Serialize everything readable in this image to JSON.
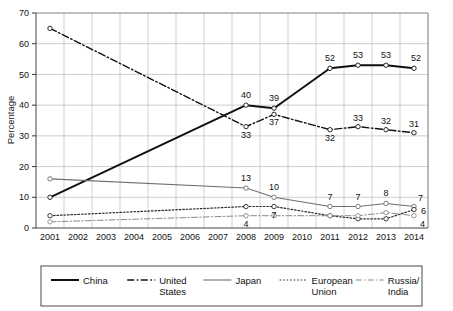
{
  "chart_data": {
    "type": "line",
    "title": "",
    "xlabel": "",
    "ylabel": "Percentage",
    "xlim": [
      2001,
      2014
    ],
    "ylim": [
      0,
      70
    ],
    "grid": true,
    "legend_position": "bottom",
    "categories": [
      2001,
      2002,
      2003,
      2004,
      2005,
      2006,
      2007,
      2008,
      2009,
      2010,
      2011,
      2012,
      2013,
      2014
    ],
    "x_tick_labels": [
      "2001",
      "2002",
      "2003",
      "2004",
      "2005",
      "2006",
      "2007",
      "2008",
      "2009",
      "2010",
      "2011",
      "2012",
      "2013",
      "2014"
    ],
    "y_tick_labels": [
      "0",
      "10",
      "20",
      "30",
      "40",
      "50",
      "60",
      "70"
    ],
    "y_ticks": [
      0,
      10,
      20,
      30,
      40,
      50,
      60,
      70
    ],
    "series": [
      {
        "name": "China",
        "style": "solid-thick",
        "color": "#111111",
        "x": [
          2001,
          2008,
          2009,
          2011,
          2012,
          2013,
          2014
        ],
        "values": [
          10,
          40,
          39,
          52,
          53,
          53,
          52
        ],
        "point_labels": [
          "",
          "40",
          "39",
          "52",
          "53",
          "53",
          "52"
        ]
      },
      {
        "name": "United States",
        "style": "dash-dot",
        "color": "#111111",
        "x": [
          2001,
          2008,
          2009,
          2011,
          2012,
          2013,
          2014
        ],
        "values": [
          65,
          33,
          37,
          32,
          33,
          32,
          31
        ],
        "point_labels": [
          "",
          "33",
          "37",
          "32",
          "33",
          "32",
          "31"
        ]
      },
      {
        "name": "Japan",
        "style": "solid-thin",
        "color": "#6e6e6e",
        "x": [
          2001,
          2008,
          2009,
          2011,
          2012,
          2013,
          2014
        ],
        "values": [
          16,
          13,
          10,
          7,
          7,
          8,
          7
        ],
        "point_labels": [
          "",
          "13",
          "10",
          "7",
          "7",
          "8",
          "7"
        ]
      },
      {
        "name": "European Union",
        "style": "dotted",
        "color": "#2a2a2a",
        "x": [
          2001,
          2008,
          2009,
          2011,
          2012,
          2013,
          2014
        ],
        "values": [
          4,
          7,
          7,
          4,
          3,
          3,
          6
        ],
        "point_labels": [
          "",
          "",
          "7",
          "",
          "",
          "",
          "6"
        ]
      },
      {
        "name": "Russia/India",
        "style": "dash-dot-thin",
        "color": "#8a8a8a",
        "x": [
          2001,
          2008,
          2009,
          2011,
          2012,
          2013,
          2014
        ],
        "values": [
          2,
          4,
          4,
          4,
          4,
          5,
          4
        ],
        "point_labels": [
          "",
          "4",
          "",
          "",
          "",
          "",
          "4"
        ]
      }
    ]
  },
  "legend": {
    "items": [
      {
        "label": "China",
        "label_line2": ""
      },
      {
        "label": "United",
        "label_line2": "States"
      },
      {
        "label": "Japan",
        "label_line2": ""
      },
      {
        "label": "European",
        "label_line2": "Union"
      },
      {
        "label": "Russia/",
        "label_line2": "India"
      }
    ]
  },
  "axis": {
    "y_title": "Percentage"
  }
}
